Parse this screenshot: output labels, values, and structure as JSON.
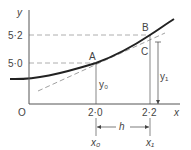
{
  "diagram": {
    "axes": {
      "y_label": "y",
      "x_label": "x",
      "origin_label": "O"
    },
    "y_ticks": [
      "5·2",
      "5·0"
    ],
    "x_ticks": [
      "2·0",
      "2·2"
    ],
    "points": {
      "A": "A",
      "B": "B",
      "C": "C"
    },
    "ordinates": {
      "y0": "y₀",
      "y1": "y₁"
    },
    "abscissae": {
      "x0": "x₀",
      "x1": "x₁"
    },
    "interval_label": "h",
    "colors": {
      "curve": "#222222",
      "axes": "#555555",
      "dashed": "#999999",
      "text": "#444444"
    }
  }
}
